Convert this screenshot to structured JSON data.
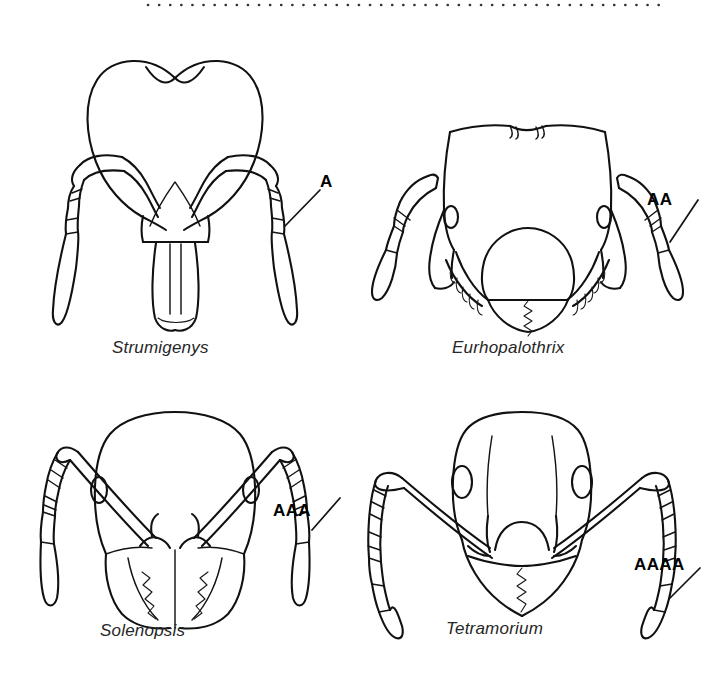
{
  "figure": {
    "background_color": "#ffffff",
    "ink_color": "#111111",
    "top_rule": {
      "name": "dotted-rule",
      "style": "dotted",
      "dot_count": 47
    }
  },
  "panels": [
    {
      "id": "strumigenys",
      "caption": "Strumigenys",
      "label": "A",
      "label_meaning": "one-segmented antennal club",
      "club_segments": 1,
      "head_shape": "heart-shaped with concave vertex",
      "mandibles": "long, linear, projecting forward",
      "antenna_segments_visible": 6,
      "label_position": {
        "x": 320,
        "y": 172
      },
      "caption_position": {
        "x": 112,
        "y": 338
      }
    },
    {
      "id": "eurhopalothrix",
      "caption": "Eurhopalothrix",
      "label": "AA",
      "label_meaning": "two-segmented antennal club",
      "club_segments": 2,
      "head_shape": "broad, boxy, flattened with notched vertex",
      "mandibles": "short, triangular, fringed with spines",
      "antenna_segments_visible": 7,
      "label_position": {
        "x": 647,
        "y": 190
      },
      "caption_position": {
        "x": 452,
        "y": 338
      }
    },
    {
      "id": "solenopsis",
      "caption": "Solenopsis",
      "label": "AAA",
      "label_meaning": "two-segmented antennal club on ten-segmented antenna",
      "club_segments": 2,
      "head_shape": "rounded rectangular, slightly domed vertex",
      "mandibles": "toothed, overlapping",
      "antenna_segments_visible": 10,
      "label_position": {
        "x": 273,
        "y": 501
      },
      "caption_position": {
        "x": 100,
        "y": 621
      }
    },
    {
      "id": "tetramorium",
      "caption": "Tetramorium",
      "label": "AAAA",
      "label_meaning": "three-segmented antennal club on twelve-segmented antenna",
      "club_segments": 3,
      "head_shape": "subrectangular with rounded posterior corners",
      "mandibles": "triangular, finely toothed",
      "antenna_segments_visible": 12,
      "label_position": {
        "x": 634,
        "y": 555
      },
      "caption_position": {
        "x": 446,
        "y": 619
      }
    }
  ]
}
